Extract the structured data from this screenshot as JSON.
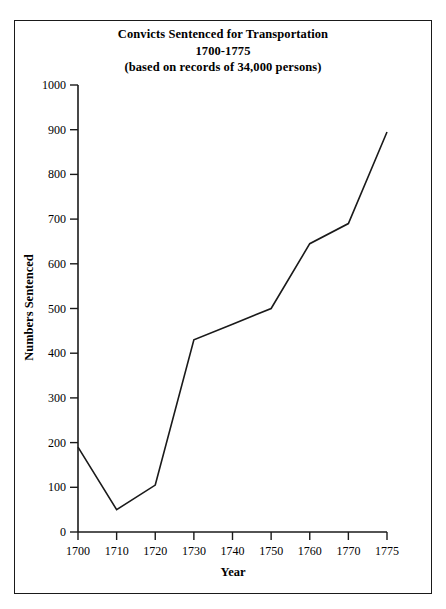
{
  "chart_data": {
    "type": "line",
    "title": "Convicts Sentenced for Transportation 1700-1775 (based on records of 34,000 persons)",
    "title_lines": [
      "Convicts Sentenced for Transportation",
      "1700-1775",
      "(based on records of 34,000 persons)"
    ],
    "xlabel": "Year",
    "ylabel": "Numbers Sentenced",
    "categories": [
      "1700",
      "1710",
      "1720",
      "1730",
      "1740",
      "1750",
      "1760",
      "1770",
      "1775"
    ],
    "values": [
      190,
      50,
      105,
      430,
      465,
      500,
      645,
      690,
      895
    ],
    "ylim": [
      0,
      1000
    ],
    "yticks": [
      "0",
      "100",
      "200",
      "300",
      "400",
      "500",
      "600",
      "700",
      "800",
      "900",
      "1000"
    ],
    "ytick_values": [
      0,
      100,
      200,
      300,
      400,
      500,
      600,
      700,
      800,
      900,
      1000
    ],
    "grid": false,
    "legend": "none",
    "line_color": "#1a1a1a",
    "background_color": "#ffffff",
    "axis_color": "#1a1a1a",
    "x_axis_spacing": "categorical"
  }
}
